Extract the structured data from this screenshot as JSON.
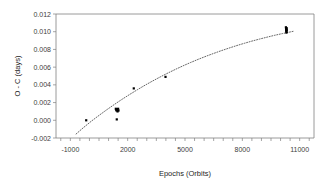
{
  "chart_data": {
    "type": "scatter",
    "title": "",
    "xlabel": "Epochs (Orbits)",
    "ylabel": "O - C (days)",
    "xlim": [
      -1750,
      11750
    ],
    "ylim": [
      -0.002,
      0.012
    ],
    "grid": false,
    "legend": null,
    "xticks": [
      -1000,
      2000,
      5000,
      8000,
      11000
    ],
    "xticklabels": [
      "-1000",
      "2000",
      "5000",
      "8000",
      "11000"
    ],
    "xminor_step": 500,
    "yticks": [
      -0.002,
      0.0,
      0.002,
      0.004,
      0.006,
      0.008,
      0.01,
      0.012
    ],
    "yticklabels": [
      "-0.002",
      "0.000",
      "0.002",
      "0.004",
      "0.006",
      "0.008",
      "0.010",
      "0.012"
    ],
    "marker": "filled-square",
    "marker_color": "#000000",
    "points": [
      {
        "x": -170,
        "y": 0.0
      },
      {
        "x": 1380,
        "y": 0.0013
      },
      {
        "x": 1400,
        "y": 0.0012
      },
      {
        "x": 1420,
        "y": 0.0011
      },
      {
        "x": 1450,
        "y": 0.0012
      },
      {
        "x": 1470,
        "y": 0.001
      },
      {
        "x": 1500,
        "y": 0.0013
      },
      {
        "x": 1520,
        "y": 0.0011
      },
      {
        "x": 1430,
        "y": 0.0001
      },
      {
        "x": 2320,
        "y": 0.0036
      },
      {
        "x": 3980,
        "y": 0.0049
      },
      {
        "x": 10280,
        "y": 0.0105
      },
      {
        "x": 10290,
        "y": 0.0103
      },
      {
        "x": 10300,
        "y": 0.0102
      },
      {
        "x": 10300,
        "y": 0.0101
      },
      {
        "x": 10310,
        "y": 0.01
      },
      {
        "x": 10310,
        "y": 0.0099
      },
      {
        "x": 10320,
        "y": 0.0104
      },
      {
        "x": 10320,
        "y": 0.0102
      }
    ],
    "trendline": {
      "style": "dotted",
      "color": "#555555",
      "description": "quadratic fit through data",
      "points": [
        {
          "x": -700,
          "y": -0.00155
        },
        {
          "x": -300,
          "y": -0.0008
        },
        {
          "x": 100,
          "y": -0.0001
        },
        {
          "x": 500,
          "y": 0.00055
        },
        {
          "x": 900,
          "y": 0.00118
        },
        {
          "x": 1300,
          "y": 0.00178
        },
        {
          "x": 1700,
          "y": 0.00236
        },
        {
          "x": 2100,
          "y": 0.00291
        },
        {
          "x": 2500,
          "y": 0.00344
        },
        {
          "x": 2900,
          "y": 0.00395
        },
        {
          "x": 3300,
          "y": 0.00443
        },
        {
          "x": 3700,
          "y": 0.00489
        },
        {
          "x": 4100,
          "y": 0.00533
        },
        {
          "x": 4500,
          "y": 0.00575
        },
        {
          "x": 4900,
          "y": 0.00615
        },
        {
          "x": 5300,
          "y": 0.00653
        },
        {
          "x": 5700,
          "y": 0.00689
        },
        {
          "x": 6100,
          "y": 0.00723
        },
        {
          "x": 6500,
          "y": 0.00755
        },
        {
          "x": 6900,
          "y": 0.00786
        },
        {
          "x": 7300,
          "y": 0.00815
        },
        {
          "x": 7700,
          "y": 0.00843
        },
        {
          "x": 8100,
          "y": 0.00869
        },
        {
          "x": 8500,
          "y": 0.00894
        },
        {
          "x": 8900,
          "y": 0.00917
        },
        {
          "x": 9300,
          "y": 0.00939
        },
        {
          "x": 9700,
          "y": 0.0096
        },
        {
          "x": 10100,
          "y": 0.00979
        },
        {
          "x": 10500,
          "y": 0.00997
        },
        {
          "x": 10700,
          "y": 0.01006
        }
      ]
    }
  }
}
